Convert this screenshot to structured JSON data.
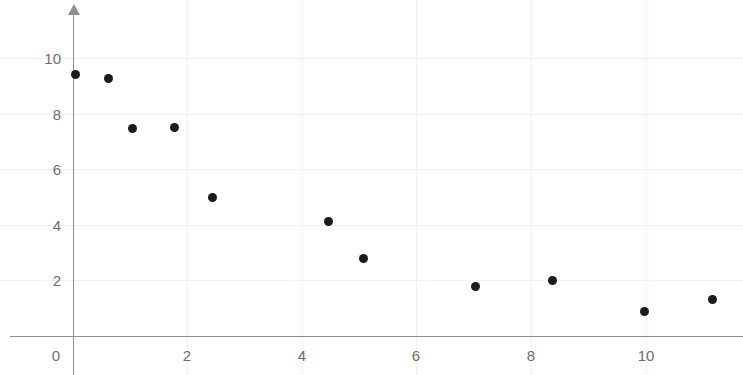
{
  "chart_data": {
    "type": "scatter",
    "title": "",
    "subtitle": "",
    "xlabel": "",
    "ylabel": "",
    "xlim": [
      -1.1,
      11.7
    ],
    "ylim": [
      -1.4,
      11.9
    ],
    "grid": true,
    "legend": null,
    "x_ticks": [
      0,
      2,
      4,
      6,
      8,
      10
    ],
    "x_tick_labels": [
      "0",
      "2",
      "4",
      "6",
      "8",
      "10"
    ],
    "y_ticks": [
      2,
      4,
      6,
      8,
      10
    ],
    "y_tick_labels": [
      "2",
      "4",
      "6",
      "8",
      "10"
    ],
    "marker_color": "#1b1b1b",
    "axis_color": "#8e8e8e",
    "grid_color": "#f1eff0",
    "tick_label_color": "#6d6d6d",
    "points": [
      {
        "x": 0.05,
        "y": 9.4
      },
      {
        "x": 0.63,
        "y": 9.25
      },
      {
        "x": 1.05,
        "y": 7.45
      },
      {
        "x": 1.78,
        "y": 7.5
      },
      {
        "x": 2.45,
        "y": 4.98
      },
      {
        "x": 4.47,
        "y": 4.1
      },
      {
        "x": 5.07,
        "y": 2.78
      },
      {
        "x": 7.04,
        "y": 1.75
      },
      {
        "x": 8.37,
        "y": 2.0
      },
      {
        "x": 9.99,
        "y": 0.88
      },
      {
        "x": 11.16,
        "y": 1.3
      }
    ]
  },
  "axes": {
    "x_axis_name": "x-axis",
    "y_axis_name": "y-axis",
    "y_axis_has_arrow": true
  }
}
